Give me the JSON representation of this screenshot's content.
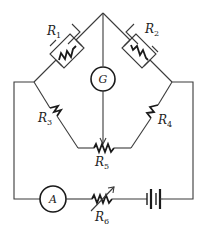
{
  "diagram": {
    "type": "wheatstone-bridge-circuit",
    "components": {
      "R1": {
        "label": "R",
        "sub": "1"
      },
      "R2": {
        "label": "R",
        "sub": "2"
      },
      "R3": {
        "label": "R",
        "sub": "3"
      },
      "R4": {
        "label": "R",
        "sub": "4"
      },
      "R5": {
        "label": "R",
        "sub": "5"
      },
      "R6": {
        "label": "R",
        "sub": "6"
      },
      "galvanometer": {
        "label": "G"
      },
      "ammeter": {
        "label": "A"
      }
    },
    "colors": {
      "wire": "#3a3a3a",
      "component": "#1a1a1a",
      "background": "#ffffff"
    }
  }
}
